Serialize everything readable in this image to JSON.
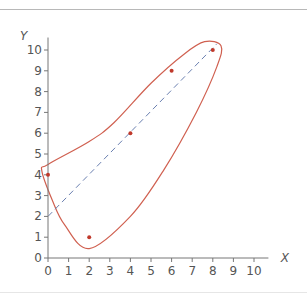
{
  "chart_data": {
    "type": "scatter",
    "title": "",
    "xlabel": "X",
    "ylabel": "Y",
    "xlim": [
      0,
      10
    ],
    "ylim": [
      0,
      10
    ],
    "grid": false,
    "x_ticks": [
      "0",
      "1",
      "2",
      "3",
      "4",
      "5",
      "6",
      "7",
      "8",
      "9",
      "10"
    ],
    "y_ticks": [
      "0",
      "1",
      "2",
      "3",
      "4",
      "5",
      "6",
      "7",
      "8",
      "9",
      "10"
    ],
    "series": [
      {
        "name": "points",
        "x": [
          0,
          2,
          4,
          6,
          8
        ],
        "y": [
          4,
          1,
          6,
          9,
          10
        ],
        "color": "#c0392b"
      }
    ],
    "regression_line": {
      "style": "dashed",
      "color": "#6a7fb0",
      "x": [
        0,
        8.2
      ],
      "y": [
        2,
        10.3
      ]
    },
    "enclosing_outline": {
      "color": "#d06050",
      "shape": "closed curve around all points"
    }
  },
  "colors": {
    "axis": "#777777",
    "point": "#c0392b",
    "outline": "#d06050",
    "dashed_line": "#6a7fb0"
  }
}
